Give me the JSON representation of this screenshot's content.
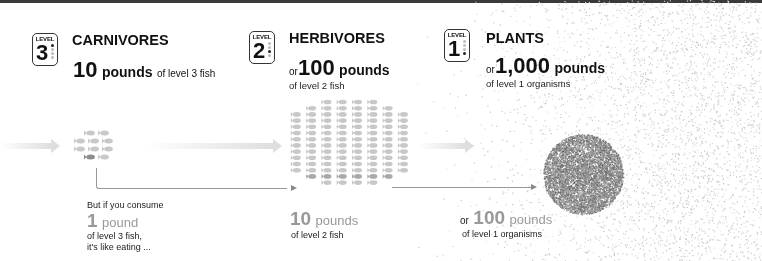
{
  "levels": [
    {
      "badge_label": "LEVEL",
      "number": "3",
      "active_dot": 1,
      "title": "CARNIVORES",
      "amount_prefix": "",
      "amount_value": "10",
      "amount_unit": "pounds",
      "amount_desc": "of level 3 fish",
      "fish_count": 10,
      "highlighted_fish": 1
    },
    {
      "badge_label": "LEVEL",
      "number": "2",
      "active_dot": 3,
      "title": "HERBIVORES",
      "amount_prefix": "or",
      "amount_value": "100",
      "amount_unit": "pounds",
      "amount_desc": "of level 2 fish",
      "fish_count": 100,
      "highlighted_fish": 10
    },
    {
      "badge_label": "LEVEL",
      "number": "1",
      "active_dot": 4,
      "title": "PLANTS",
      "amount_prefix": "or",
      "amount_value": "1,000",
      "amount_unit": "pounds",
      "amount_desc": "of level 1 organisms"
    }
  ],
  "comparison": {
    "intro": "But if you consume",
    "consume_value": "1",
    "consume_unit": "pound",
    "consume_desc_line1": "of level 3 fish,",
    "consume_desc_line2": "it's like eating ...",
    "equiv_level2_value": "10",
    "equiv_level2_unit": "pounds",
    "equiv_level2_desc": "of level 2 fish",
    "equiv_level1_prefix": "or",
    "equiv_level1_value": "100",
    "equiv_level1_unit": "pounds",
    "equiv_level1_desc": "of level 1 organisms"
  },
  "colors": {
    "fish_light": "#c8c8c8",
    "fish_dark": "#8c8c8c",
    "noise_light": "#cfcfcf",
    "noise_dark": "#7a7a7a",
    "text_grey": "#999999"
  }
}
